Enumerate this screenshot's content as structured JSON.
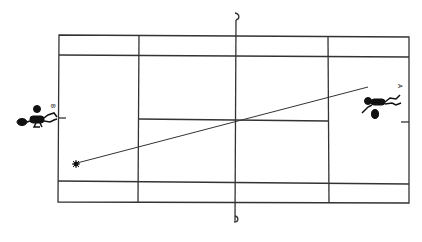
{
  "diagram": {
    "type": "tennis-court-top-view",
    "court": {
      "baseline_left_x": 58,
      "baseline_right_x": 409,
      "sideline_top_y": 35,
      "sideline_bottom_y": 202,
      "doubles_top_y": 55,
      "doubles_bottom_y": 182,
      "service_left_x": 139,
      "service_right_x": 328,
      "center_service_y": 120,
      "net_x": 236,
      "line_color": "#333333"
    },
    "players": [
      {
        "label": "B",
        "side": "left"
      },
      {
        "label": "A",
        "side": "right"
      }
    ],
    "shot": {
      "from": [
        76,
        164
      ],
      "to": [
        368,
        87
      ],
      "description": "ball trajectory from left court to player A"
    }
  }
}
